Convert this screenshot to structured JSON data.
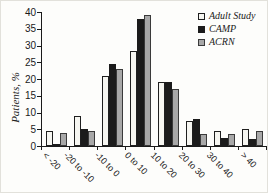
{
  "chart_data": {
    "type": "bar",
    "categories": [
      "< -20",
      "-20 to -10",
      "-10 to 0",
      "0 to 10",
      "10 to 20",
      "20 to 30",
      "30 to 40",
      "> 40"
    ],
    "series": [
      {
        "name": "Adult Study",
        "color": "#f6f6f1",
        "border": "#1f1f1f",
        "values": [
          4.5,
          9,
          21,
          28.5,
          19,
          7.5,
          4.5,
          5
        ]
      },
      {
        "name": "CAMP",
        "color": "#1b1b1b",
        "border": "#1b1b1b",
        "values": [
          0.5,
          5,
          24.5,
          38,
          19,
          8,
          2.5,
          2
        ]
      },
      {
        "name": "ACRN",
        "color": "#a8a8a8",
        "border": "#3a3a3a",
        "values": [
          4,
          4.5,
          23,
          39,
          17,
          3.5,
          3.5,
          4.5
        ]
      }
    ],
    "ylabel": "Patients, %",
    "xlabel": "",
    "ylim": [
      0,
      40
    ],
    "yticks": [
      0,
      5,
      10,
      15,
      20,
      25,
      30,
      35,
      40
    ],
    "grid": false,
    "legend_position": "upper right"
  }
}
